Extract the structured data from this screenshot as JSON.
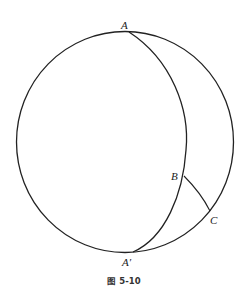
{
  "figure": {
    "caption": "图 5-10",
    "points": {
      "A": "A",
      "A_prime": "A′",
      "B": "B",
      "C": "C"
    },
    "stroke_color": "#222222",
    "background": "#ffffff"
  }
}
